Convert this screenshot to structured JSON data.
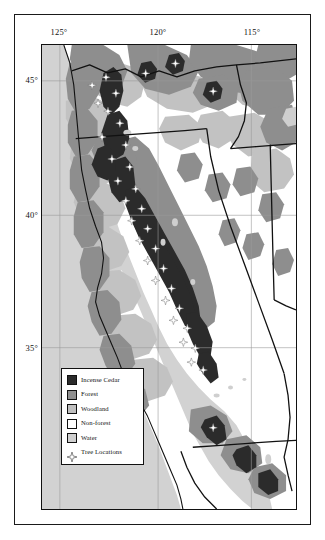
{
  "figure": {
    "projection_note": ""
  },
  "axes": {
    "longitude_ticks": [
      {
        "label": "125°",
        "value": -125,
        "x_px": 59
      },
      {
        "label": "120°",
        "value": -120,
        "x_px": 158
      },
      {
        "label": "115°",
        "value": -115,
        "x_px": 252
      }
    ],
    "latitude_ticks": [
      {
        "label": "45°",
        "value": 45,
        "y_px": 80
      },
      {
        "label": "40°",
        "value": 40,
        "y_px": 215
      },
      {
        "label": "35°",
        "value": 35,
        "y_px": 348
      }
    ]
  },
  "legend": {
    "items": [
      {
        "label": "Incense Cedar",
        "symbol": "square-swatch",
        "color": "#2b2b2b"
      },
      {
        "label": "Forest",
        "symbol": "square-swatch",
        "color": "#8e8e8e"
      },
      {
        "label": "Woodland",
        "symbol": "square-swatch",
        "color": "#bfbfbf"
      },
      {
        "label": "Non-forest",
        "symbol": "square-swatch",
        "color": "#ffffff"
      },
      {
        "label": "Water",
        "symbol": "square-swatch",
        "color": "#cfcfcf"
      },
      {
        "label": "Tree Locations",
        "symbol": "star-marker",
        "color": "#ffffff"
      }
    ]
  },
  "colors": {
    "incense_cedar": "#2b2b2b",
    "forest": "#8e8e8e",
    "woodland": "#bfbfbf",
    "non_forest": "#ffffff",
    "water": "#cfcfcf",
    "ocean": "#d2d2d2",
    "boundary_line": "#111111",
    "graticule": "#9a9a9a",
    "frame": "#111111",
    "background": "#ffffff"
  },
  "map_features": {
    "graticule_vertical_px": [
      59,
      158,
      252
    ],
    "graticule_horizontal_px": [
      80,
      215,
      348
    ],
    "tree_location_count_visible": 34
  }
}
